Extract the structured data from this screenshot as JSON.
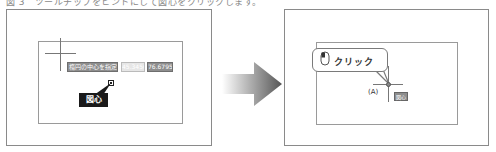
{
  "caption": "図 3　ツールチップをヒントにして図心をクリックします。",
  "left_panel": {
    "tooltip": {
      "prompt_label": "楕円の中心を指定",
      "x_value": "45.3456",
      "y_value": "76.6795"
    },
    "callout_label": "図心"
  },
  "arrow": {
    "direction": "right",
    "color_start": "#ffffff",
    "color_end": "#555555"
  },
  "right_panel": {
    "bubble_text": "クリック",
    "point_label": "(A)",
    "snap_label": "図心"
  },
  "colors": {
    "frame": "#8a8a8a",
    "tooltip_bg": "#8e8e8e",
    "callout_bg": "#1a1a1a"
  }
}
